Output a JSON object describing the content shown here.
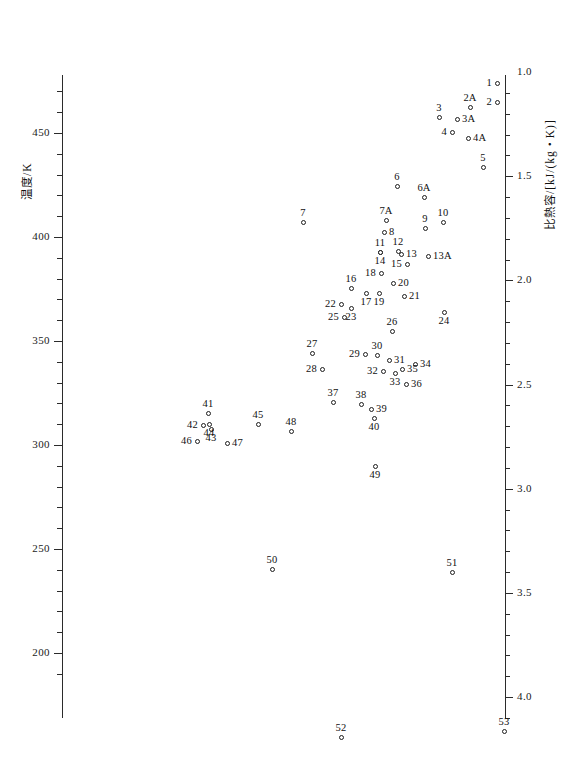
{
  "figure": {
    "background_color": "#ffffff",
    "ink_color": "#1d1d1d",
    "width": 567,
    "height": 784
  },
  "left_axis": {
    "title": "温度/K",
    "tick_labels": [
      "450",
      "400",
      "350",
      "300",
      "250",
      "200"
    ],
    "tick_values": [
      450,
      400,
      350,
      300,
      250,
      200
    ],
    "minor_step": 10,
    "range": [
      185,
      470
    ]
  },
  "right_axis": {
    "title": "比熱容/[kJ/(kg・K)]",
    "tick_labels": [
      "1.0",
      "1.5",
      "2.0",
      "2.5",
      "3.0",
      "3.5",
      "4.0"
    ],
    "tick_values": [
      1.0,
      1.5,
      2.0,
      2.5,
      3.0,
      3.5,
      4.0
    ],
    "minor_step": 0.1,
    "range": [
      0.75,
      4.25
    ]
  },
  "chart_data": {
    "type": "scatter",
    "title": "",
    "xlabel": "",
    "ylabel": "温度/K",
    "y2label": "比熱容/[kJ/(kg・K)]",
    "grid": false,
    "legend": "none",
    "ylim": [
      185,
      470
    ],
    "y2lim": [
      0.75,
      4.25
    ],
    "marker": "open-circle",
    "note": "Each point is identified by a numeric (or numeric+letter) substance index label. x position carries no axis; the horizontal spread separates substances. y is temperature in K (left axis) which maps to specific heat capacity on the right axis.",
    "points": [
      {
        "label": "1",
        "px": 497,
        "py": 83,
        "temperature_K": 474,
        "specific_heat": 1.05,
        "label_pos": "left"
      },
      {
        "label": "2",
        "px": 497,
        "py": 102,
        "temperature_K": 465,
        "specific_heat": 1.14,
        "label_pos": "left"
      },
      {
        "label": "2A",
        "px": 470,
        "py": 107,
        "temperature_K": 462,
        "specific_heat": 1.17,
        "label_pos": "above"
      },
      {
        "label": "3",
        "px": 439,
        "py": 117,
        "temperature_K": 458,
        "specific_heat": 1.22,
        "label_pos": "above"
      },
      {
        "label": "3A",
        "px": 457,
        "py": 119,
        "temperature_K": 457,
        "specific_heat": 1.23,
        "label_pos": "right"
      },
      {
        "label": "4",
        "px": 452,
        "py": 132,
        "temperature_K": 450,
        "specific_heat": 1.29,
        "label_pos": "left"
      },
      {
        "label": "4A",
        "px": 468,
        "py": 138,
        "temperature_K": 448,
        "specific_heat": 1.32,
        "label_pos": "right"
      },
      {
        "label": "5",
        "px": 483,
        "py": 167,
        "temperature_K": 434,
        "specific_heat": 1.46,
        "label_pos": "above"
      },
      {
        "label": "6",
        "px": 397,
        "py": 186,
        "temperature_K": 425,
        "specific_heat": 1.55,
        "label_pos": "above"
      },
      {
        "label": "6A",
        "px": 424,
        "py": 197,
        "temperature_K": 419,
        "specific_heat": 1.6,
        "label_pos": "above"
      },
      {
        "label": "7",
        "px": 303,
        "py": 222,
        "temperature_K": 407,
        "specific_heat": 1.72,
        "label_pos": "above"
      },
      {
        "label": "7A",
        "px": 386,
        "py": 220,
        "temperature_K": 408,
        "specific_heat": 1.71,
        "label_pos": "above"
      },
      {
        "label": "8",
        "px": 384,
        "py": 232,
        "temperature_K": 403,
        "specific_heat": 1.77,
        "label_pos": "right"
      },
      {
        "label": "9",
        "px": 425,
        "py": 228,
        "temperature_K": 405,
        "specific_heat": 1.75,
        "label_pos": "above"
      },
      {
        "label": "10",
        "px": 443,
        "py": 222,
        "temperature_K": 407,
        "specific_heat": 1.72,
        "label_pos": "above"
      },
      {
        "label": "11",
        "px": 380,
        "py": 252,
        "temperature_K": 393,
        "specific_heat": 1.86,
        "label_pos": "above"
      },
      {
        "label": "12",
        "px": 398,
        "py": 251,
        "temperature_K": 394,
        "specific_heat": 1.86,
        "label_pos": "above"
      },
      {
        "label": "13",
        "px": 401,
        "py": 254,
        "temperature_K": 392,
        "specific_heat": 1.87,
        "label_pos": "right"
      },
      {
        "label": "13A",
        "px": 428,
        "py": 256,
        "temperature_K": 391,
        "specific_heat": 1.88,
        "label_pos": "right"
      },
      {
        "label": "14",
        "px": 380,
        "py": 252,
        "temperature_K": 393,
        "specific_heat": 1.86,
        "label_pos": "below"
      },
      {
        "label": "15",
        "px": 407,
        "py": 264,
        "temperature_K": 387,
        "specific_heat": 1.92,
        "label_pos": "left"
      },
      {
        "label": "16",
        "px": 351,
        "py": 288,
        "temperature_K": 376,
        "specific_heat": 2.03,
        "label_pos": "above"
      },
      {
        "label": "17",
        "px": 366,
        "py": 293,
        "temperature_K": 373,
        "specific_heat": 2.05,
        "label_pos": "below"
      },
      {
        "label": "18",
        "px": 381,
        "py": 273,
        "temperature_K": 383,
        "specific_heat": 1.96,
        "label_pos": "left"
      },
      {
        "label": "19",
        "px": 379,
        "py": 293,
        "temperature_K": 373,
        "specific_heat": 2.05,
        "label_pos": "below"
      },
      {
        "label": "20",
        "px": 393,
        "py": 283,
        "temperature_K": 378,
        "specific_heat": 2.0,
        "label_pos": "right"
      },
      {
        "label": "21",
        "px": 404,
        "py": 296,
        "temperature_K": 372,
        "specific_heat": 2.06,
        "label_pos": "right"
      },
      {
        "label": "22",
        "px": 341,
        "py": 304,
        "temperature_K": 368,
        "specific_heat": 2.1,
        "label_pos": "left"
      },
      {
        "label": "23",
        "px": 351,
        "py": 308,
        "temperature_K": 366,
        "specific_heat": 2.12,
        "label_pos": "below"
      },
      {
        "label": "24",
        "px": 444,
        "py": 312,
        "temperature_K": 364,
        "specific_heat": 2.14,
        "label_pos": "below"
      },
      {
        "label": "25",
        "px": 344,
        "py": 317,
        "temperature_K": 360,
        "specific_heat": 2.18,
        "label_pos": "left"
      },
      {
        "label": "26",
        "px": 392,
        "py": 331,
        "temperature_K": 353,
        "specific_heat": 2.24,
        "label_pos": "above"
      },
      {
        "label": "27",
        "px": 312,
        "py": 353,
        "temperature_K": 343,
        "specific_heat": 2.34,
        "label_pos": "above"
      },
      {
        "label": "28",
        "px": 322,
        "py": 369,
        "temperature_K": 335,
        "specific_heat": 2.41,
        "label_pos": "left"
      },
      {
        "label": "29",
        "px": 365,
        "py": 354,
        "temperature_K": 342,
        "specific_heat": 2.34,
        "label_pos": "left"
      },
      {
        "label": "30",
        "px": 377,
        "py": 355,
        "temperature_K": 342,
        "specific_heat": 2.35,
        "label_pos": "above"
      },
      {
        "label": "31",
        "px": 389,
        "py": 360,
        "temperature_K": 339,
        "specific_heat": 2.37,
        "label_pos": "right"
      },
      {
        "label": "32",
        "px": 383,
        "py": 371,
        "temperature_K": 334,
        "specific_heat": 2.42,
        "label_pos": "left"
      },
      {
        "label": "33",
        "px": 395,
        "py": 373,
        "temperature_K": 333,
        "specific_heat": 2.43,
        "label_pos": "below"
      },
      {
        "label": "34",
        "px": 415,
        "py": 364,
        "temperature_K": 337,
        "specific_heat": 2.39,
        "label_pos": "right"
      },
      {
        "label": "35",
        "px": 402,
        "py": 369,
        "temperature_K": 335,
        "specific_heat": 2.41,
        "label_pos": "right"
      },
      {
        "label": "36",
        "px": 406,
        "py": 384,
        "temperature_K": 328,
        "specific_heat": 2.48,
        "label_pos": "right"
      },
      {
        "label": "37",
        "px": 333,
        "py": 402,
        "temperature_K": 319,
        "specific_heat": 2.56,
        "label_pos": "above"
      },
      {
        "label": "38",
        "px": 361,
        "py": 404,
        "temperature_K": 318,
        "specific_heat": 2.57,
        "label_pos": "above"
      },
      {
        "label": "39",
        "px": 371,
        "py": 409,
        "temperature_K": 316,
        "specific_heat": 2.59,
        "label_pos": "right"
      },
      {
        "label": "40",
        "px": 374,
        "py": 418,
        "temperature_K": 312,
        "specific_heat": 2.63,
        "label_pos": "below"
      },
      {
        "label": "41",
        "px": 208,
        "py": 413,
        "temperature_K": 314,
        "specific_heat": 2.61,
        "label_pos": "above"
      },
      {
        "label": "42",
        "px": 203,
        "py": 425,
        "temperature_K": 308,
        "specific_heat": 2.66,
        "label_pos": "left"
      },
      {
        "label": "43",
        "px": 211,
        "py": 429,
        "temperature_K": 306,
        "specific_heat": 2.68,
        "label_pos": "below"
      },
      {
        "label": "44",
        "px": 209,
        "py": 424,
        "temperature_K": 309,
        "specific_heat": 2.66,
        "label_pos": "below"
      },
      {
        "label": "45",
        "px": 258,
        "py": 424,
        "temperature_K": 309,
        "specific_heat": 2.66,
        "label_pos": "above"
      },
      {
        "label": "46",
        "px": 197,
        "py": 441,
        "temperature_K": 301,
        "specific_heat": 2.74,
        "label_pos": "left"
      },
      {
        "label": "47",
        "px": 227,
        "py": 443,
        "temperature_K": 300,
        "specific_heat": 2.75,
        "label_pos": "right"
      },
      {
        "label": "48",
        "px": 291,
        "py": 431,
        "temperature_K": 306,
        "specific_heat": 2.69,
        "label_pos": "above"
      },
      {
        "label": "49",
        "px": 375,
        "py": 466,
        "temperature_K": 289,
        "specific_heat": 2.87,
        "label_pos": "below"
      },
      {
        "label": "50",
        "px": 272,
        "py": 569,
        "temperature_K": 240,
        "specific_heat": 3.35,
        "label_pos": "above"
      },
      {
        "label": "51",
        "px": 452,
        "py": 572,
        "temperature_K": 239,
        "specific_heat": 3.37,
        "label_pos": "above"
      },
      {
        "label": "52",
        "px": 341,
        "py": 737,
        "temperature_K": 160,
        "specific_heat": 4.17,
        "label_pos": "above"
      },
      {
        "label": "53",
        "px": 504,
        "py": 731,
        "temperature_K": 163,
        "specific_heat": 4.14,
        "label_pos": "above"
      }
    ]
  }
}
